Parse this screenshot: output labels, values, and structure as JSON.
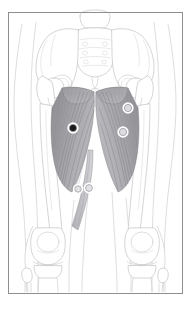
{
  "figure": {
    "title": "Anterior pelvis and thigh anatomy with marker points",
    "view": "anterior",
    "canvas": {
      "width": 191,
      "height": 309,
      "background": "#ffffff"
    },
    "frame": {
      "name": "image-border",
      "x": 8,
      "y": 12,
      "width": 174,
      "height": 281,
      "stroke_color": "#8e8e8e",
      "stroke_width": 1
    },
    "palette": {
      "background": "#ffffff",
      "bone_outline": "#b9b9bc",
      "skin_outline": "#c7c7cb",
      "muscle_fill_light": "#b4b4b8",
      "muscle_fill_dark": "#8d8d92",
      "muscle_fiber": "#6f6f74",
      "frame": "#8e8e8e",
      "marker_filled": "#1a1a1a",
      "marker_hollow": "#d8d8dc",
      "marker_ring": "#ffffff"
    },
    "structures": [
      {
        "name": "sacrum",
        "label": "Sacrum",
        "side": "midline"
      },
      {
        "name": "ilium-left",
        "label": "Ilium (left)",
        "side": "left"
      },
      {
        "name": "ilium-right",
        "label": "Ilium (right)",
        "side": "right"
      },
      {
        "name": "pubic-symphysis",
        "label": "Pubic symphysis",
        "side": "midline"
      },
      {
        "name": "femur-left",
        "label": "Femur (left)",
        "side": "left"
      },
      {
        "name": "femur-right",
        "label": "Femur (right)",
        "side": "right"
      },
      {
        "name": "patella-left",
        "label": "Patella (left)",
        "side": "left"
      },
      {
        "name": "patella-right",
        "label": "Patella (right)",
        "side": "right"
      },
      {
        "name": "tibia-left",
        "label": "Tibia (left)",
        "side": "left"
      },
      {
        "name": "tibia-right",
        "label": "Tibia (right)",
        "side": "right"
      },
      {
        "name": "fibula-left",
        "label": "Fibula (left)",
        "side": "left"
      },
      {
        "name": "fibula-right",
        "label": "Fibula (right)",
        "side": "right"
      },
      {
        "name": "adductor-group-left",
        "label": "Adductor muscle group (left)",
        "side": "left"
      },
      {
        "name": "adductor-group-right",
        "label": "Adductor muscle group (right)",
        "side": "right"
      },
      {
        "name": "gracilis-left",
        "label": "Gracilis (left)",
        "side": "left"
      }
    ],
    "markers": [
      {
        "id": 1,
        "name": "marker-point-1",
        "style": "filled",
        "fill": "#1a1a1a",
        "cx": 73,
        "cy": 128,
        "r": 3.6,
        "region": "adductor-group-left"
      },
      {
        "id": 2,
        "name": "marker-point-2",
        "style": "hollow",
        "fill": "#dcdce0",
        "cx": 128,
        "cy": 108,
        "r": 3.6,
        "region": "adductor-group-right"
      },
      {
        "id": 3,
        "name": "marker-point-3",
        "style": "hollow",
        "fill": "#dcdce0",
        "cx": 123,
        "cy": 132,
        "r": 3.6,
        "region": "adductor-group-right"
      },
      {
        "id": 4,
        "name": "marker-point-4",
        "style": "hollow",
        "fill": "#e3e3e6",
        "cx": 89,
        "cy": 188,
        "r": 3.4,
        "region": "gracilis-left"
      },
      {
        "id": 5,
        "name": "marker-point-5",
        "style": "hollow",
        "fill": "#e3e3e6",
        "cx": 78,
        "cy": 189,
        "r": 3.2,
        "region": "adductor-left-distal"
      }
    ],
    "marker_count": 5
  }
}
